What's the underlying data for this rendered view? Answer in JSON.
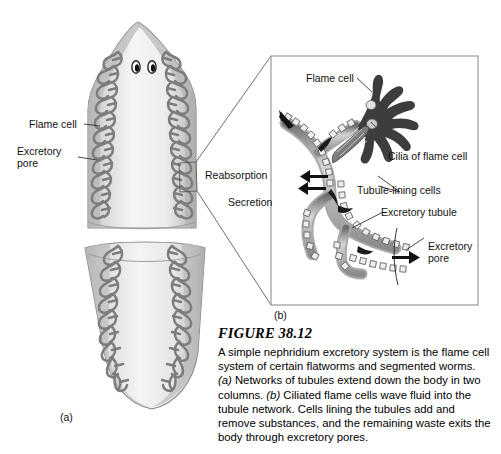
{
  "figure": {
    "number_label": "FIGURE 38.12",
    "caption": "A simple nephridium excretory system is the flame cell system of certain flatworms and segmented worms. (a) Networks of tubules extend down the body in two columns. (b) Ciliated flame cells wave fluid into the tubule network. Cells lining the tubules add and remove substances, and the remaining waste exits the body through excretory pores.",
    "caption_lines": [
      "A simple nephridium excretory system is the flame cell",
      "system of certain flatworms and segmented worms.",
      "(a) Networks of tubules extend down the body in two",
      "columns. (b) Ciliated flame cells wave fluid into the",
      "tubule network. Cells lining the tubules add and",
      "remove substances, and the remaining waste exits the",
      "body through excretory pores."
    ]
  },
  "panels": {
    "a": {
      "tag": "(a)",
      "title": "planarian whole-body flame cell network"
    },
    "b": {
      "tag": "(b)",
      "title": "magnified flame cell and excretory tubule"
    }
  },
  "labels": {
    "organism_flame_cell": "Flame cell",
    "organism_excretory_pore": "Excretory\npore",
    "reabsorption": "Reabsorption",
    "secretion": "Secretion",
    "inset_flame_cell": "Flame cell",
    "cilia_of_flame_cell": "Cilia of flame cell",
    "tubule_lining_cells": "Tubule-lining cells",
    "excretory_tubule": "Excretory tubule",
    "inset_excretory_pore": "Excretory\npore"
  },
  "colors": {
    "page_background": "#ffffff",
    "ink": "#111111",
    "body_fill_light": "#f2f2f2",
    "body_fill_mid": "#cfcfcf",
    "body_edge_dark": "#8d8d8d",
    "tubule_gray": "#8b8b8b",
    "tubule_dark": "#6e6e6e",
    "flame_cell_dark": "#3a3a3a",
    "inset_border": "#9a9a9a",
    "leader_line": "#333333"
  }
}
